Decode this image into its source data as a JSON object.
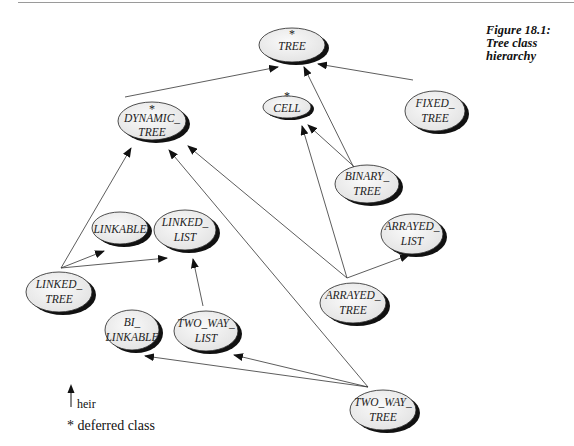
{
  "caption": {
    "line1": "Figure 18.1:",
    "line2": "Tree class hierarchy"
  },
  "legend": {
    "heir_label": "heir",
    "deferred_label": "* deferred class"
  },
  "nodes": [
    {
      "id": "TREE",
      "lines": [
        "TREE"
      ],
      "deferred": true
    },
    {
      "id": "DYNAMIC_TREE",
      "lines": [
        "DYNAMIC_",
        "TREE"
      ],
      "deferred": true
    },
    {
      "id": "CELL",
      "lines": [
        "CELL"
      ],
      "deferred": true
    },
    {
      "id": "FIXED_TREE",
      "lines": [
        "FIXED_",
        "TREE"
      ],
      "deferred": false
    },
    {
      "id": "BINARY_TREE",
      "lines": [
        "BINARY_",
        "TREE"
      ],
      "deferred": false
    },
    {
      "id": "LINKABLE",
      "lines": [
        "LINKABLE"
      ],
      "deferred": false
    },
    {
      "id": "LINKED_LIST",
      "lines": [
        "LINKED_",
        "LIST"
      ],
      "deferred": false
    },
    {
      "id": "ARRAYED_LIST",
      "lines": [
        "ARRAYED_",
        "LIST"
      ],
      "deferred": false
    },
    {
      "id": "LINKED_TREE",
      "lines": [
        "LINKED_",
        "TREE"
      ],
      "deferred": false
    },
    {
      "id": "ARRAYED_TREE",
      "lines": [
        "ARRAYED_",
        "TREE"
      ],
      "deferred": false
    },
    {
      "id": "BI_LINKABLE",
      "lines": [
        "BI_",
        "LINKABLE"
      ],
      "deferred": false
    },
    {
      "id": "TWO_WAY_LIST",
      "lines": [
        "TWO_WAY_",
        "LIST"
      ],
      "deferred": false
    },
    {
      "id": "TWO_WAY_TREE",
      "lines": [
        "TWO_WAY_",
        "TREE"
      ],
      "deferred": false
    }
  ],
  "edges": [
    {
      "from": "DYNAMIC_TREE",
      "to": "TREE"
    },
    {
      "from": "BINARY_TREE",
      "to": "TREE"
    },
    {
      "from": "FIXED_TREE",
      "to": "TREE"
    },
    {
      "from": "BINARY_TREE",
      "to": "CELL"
    },
    {
      "from": "ARRAYED_TREE",
      "to": "CELL"
    },
    {
      "from": "LINKED_TREE",
      "to": "DYNAMIC_TREE"
    },
    {
      "from": "ARRAYED_TREE",
      "to": "DYNAMIC_TREE"
    },
    {
      "from": "TWO_WAY_TREE",
      "to": "DYNAMIC_TREE"
    },
    {
      "from": "LINKED_TREE",
      "to": "LINKABLE"
    },
    {
      "from": "LINKED_TREE",
      "to": "LINKED_LIST"
    },
    {
      "from": "ARRAYED_TREE",
      "to": "ARRAYED_LIST"
    },
    {
      "from": "TWO_WAY_LIST",
      "to": "LINKED_LIST"
    },
    {
      "from": "TWO_WAY_TREE",
      "to": "BI_LINKABLE"
    },
    {
      "from": "TWO_WAY_TREE",
      "to": "TWO_WAY_LIST"
    }
  ],
  "deferred_marker": "*"
}
